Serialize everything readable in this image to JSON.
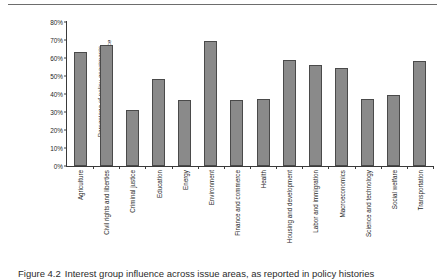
{
  "figure": {
    "caption_label": "Figure 4.2",
    "caption_text": "Interest group influence across issue areas, as reported in policy histories",
    "top_rule": true
  },
  "chart_data": {
    "type": "bar",
    "title": "",
    "xlabel": "",
    "ylabel": "Percentage of policy enactments with reported interest group influence",
    "ylabel_line_1": "Percentage of policy enactments",
    "ylabel_line_2": "with reported interest group influence",
    "ylim": [
      0,
      80
    ],
    "ytick_values": [
      0,
      10,
      20,
      30,
      40,
      50,
      60,
      70,
      80
    ],
    "ytick_labels": [
      "0%",
      "10%",
      "20%",
      "30%",
      "40%",
      "50%",
      "60%",
      "70%",
      "80%"
    ],
    "grid": false,
    "legend": false,
    "bar_color": "#8a8a8a",
    "bar_edge_color": "#4a4a4a",
    "axis_color": "#3a3a3a",
    "categories": [
      "Agriculture",
      "Civil rights  and liberties",
      "Criminal justice",
      "Education",
      "Energy",
      "Environment",
      "Finance and commerce",
      "Health",
      "Housing and development",
      "Labor and immigration",
      "Macroeconomics",
      "Science and technology",
      "Social welfare",
      "Transportation"
    ],
    "values": [
      63.5,
      67.5,
      31,
      48.5,
      36.5,
      69.5,
      36.5,
      37,
      59,
      56,
      54.5,
      37.5,
      39.5,
      58.5
    ]
  }
}
